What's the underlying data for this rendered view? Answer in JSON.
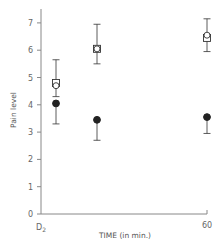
{
  "chart_data": {
    "type": "scatter",
    "title": "",
    "xlabel": "TIME (in min.)",
    "ylabel": "Pain level",
    "x_tick_labels": [
      "D2",
      "60"
    ],
    "x_tick_label_first_main": "D",
    "x_tick_label_first_sub": "2",
    "y_ticks": [
      0,
      1,
      2,
      3,
      4,
      5,
      6,
      7
    ],
    "ylim": [
      0,
      7.4
    ],
    "grid": false,
    "legend": "none",
    "categories": [
      "t1",
      "t2",
      "60"
    ],
    "series": [
      {
        "name": "open-square",
        "marker": "square-open",
        "values": [
          4.8,
          6.05,
          6.45
        ],
        "error_upper": [
          5.65,
          6.95,
          7.15
        ],
        "error_lower": [
          4.3,
          5.5,
          5.95
        ]
      },
      {
        "name": "open-circle",
        "marker": "circle-open",
        "values": [
          4.7,
          6.05,
          6.55
        ]
      },
      {
        "name": "filled-circle",
        "marker": "circle-filled",
        "values": [
          4.05,
          3.45,
          3.55
        ],
        "error_upper": [
          4.05,
          3.45,
          3.55
        ],
        "error_lower": [
          3.3,
          2.7,
          2.95
        ]
      }
    ]
  },
  "colors": {
    "axis": "#777777",
    "marker": "#333333",
    "text": "#555555"
  }
}
